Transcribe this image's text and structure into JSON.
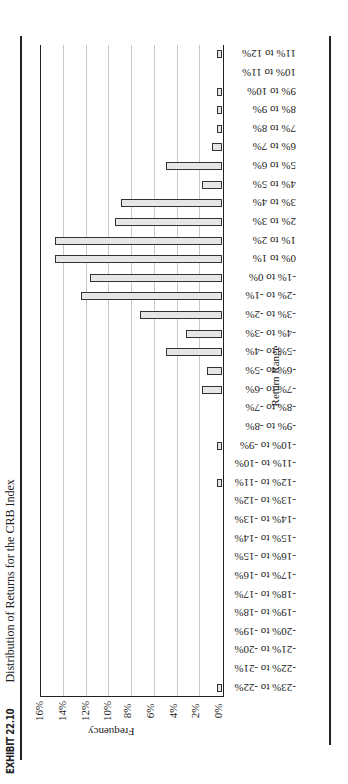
{
  "title": {
    "exhibit": "EXHIBIT 22.10",
    "text": "Distribution of Returns for the CRB Index"
  },
  "axes": {
    "y_title": "Frequency",
    "x_title": "Return Range"
  },
  "colors": {
    "bar_fill": "#e6e6e6",
    "bar_stroke": "#333333",
    "grid": "#c8c8c8",
    "frame": "#222222"
  },
  "chart_data": {
    "type": "bar",
    "orientation": "vertical bars (page rotated 90° counter-clockwise in screenshot)",
    "title": "EXHIBIT 22.10 Distribution of Returns for the CRB Index",
    "xlabel": "Return Range",
    "ylabel": "Frequency",
    "ylim": [
      0,
      16
    ],
    "yticks": [
      "0%",
      "2%",
      "4%",
      "6%",
      "8%",
      "10%",
      "12%",
      "14%",
      "16%"
    ],
    "grid": true,
    "legend": null,
    "categories": [
      "-23% to -22%",
      "-22% to -21%",
      "-21% to -20%",
      "-20% to -19%",
      "-19% to -18%",
      "-18% to -17%",
      "-17% to -16%",
      "-16% to -15%",
      "-15% to -14%",
      "-14% to -13%",
      "-13% to -12%",
      "-12% to -11%",
      "-11% to -10%",
      "-10% to -9%",
      "-9% to -8%",
      "-8% to -7%",
      "-7% to -6%",
      "-6% to -5%",
      "-5% to -4%",
      "-4% to -3%",
      "-3% to -2%",
      "-2% to -1%",
      "-1% to 0%",
      "0% to 1%",
      "1% to 2%",
      "2% to 3%",
      "3% to 4%",
      "4% to 5%",
      "5% to 6%",
      "6% to 7%",
      "7% to 8%",
      "8% to 9%",
      "9% to 10%",
      "10% to 11%",
      "11% to 12%"
    ],
    "values": [
      0.4,
      0,
      0,
      0,
      0,
      0,
      0,
      0,
      0,
      0,
      0,
      0.4,
      0,
      0.4,
      0,
      0,
      1.8,
      1.3,
      4.9,
      3.2,
      7.2,
      12.4,
      11.6,
      14.7,
      14.7,
      9.4,
      8.9,
      1.8,
      4.9,
      0.9,
      0.4,
      0.4,
      0.4,
      0,
      0.4
    ],
    "unit": "%"
  }
}
